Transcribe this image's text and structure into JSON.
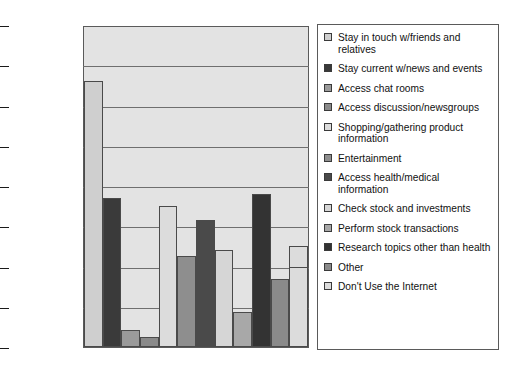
{
  "chart_data": {
    "type": "bar",
    "title": "",
    "subtitle": "",
    "xlabel": "",
    "ylabel": "",
    "ylim": [
      0,
      80
    ],
    "ytick_labels": [
      "80.00%",
      "70.00%",
      "60.00%",
      "50.00%",
      "40.00%",
      "30.00%",
      "20.00%",
      "10.00%",
      "0.00%"
    ],
    "ytick_values": [
      80,
      70,
      60,
      50,
      40,
      30,
      20,
      10,
      0
    ],
    "grid": true,
    "legend_position": "right",
    "categories": [
      "Stay in touch w/friends and relatives",
      "Stay current w/news and events",
      "Access chat rooms",
      "Access discussion/newsgroups",
      "Shopping/gathering product information",
      "Entertainment",
      "Access health/medical information",
      "Check stock and investments",
      "Perform stock transactions",
      "Research topics other than health",
      "Other",
      "Don't Use the Internet"
    ],
    "values": [
      66.0,
      37.0,
      4.3,
      2.5,
      35.0,
      22.5,
      31.5,
      24.0,
      8.8,
      38.0,
      16.8,
      25.0
    ],
    "bar_colors": [
      "#cfcfcf",
      "#3a3a3a",
      "#9a9a9a",
      "#8a8a8a",
      "#dcdcdc",
      "#8e8e8e",
      "#4a4a4a",
      "#d6d6d6",
      "#a8a8a8",
      "#333333",
      "#8a8a8a",
      "#dcdcdc"
    ],
    "annotations": [
      {
        "series_index": 12,
        "note": "inner segment at 20.00%",
        "value": 20.0
      }
    ],
    "plot_background": "#e3e3e3",
    "axis_color": "#5a5a5a"
  },
  "legend": {
    "items": [
      {
        "label": "Stay in touch w/friends and relatives",
        "color": "#cfcfcf"
      },
      {
        "label": "Stay current w/news and events",
        "color": "#3a3a3a"
      },
      {
        "label": "Access chat rooms",
        "color": "#9a9a9a"
      },
      {
        "label": "Access discussion/newsgroups",
        "color": "#8a8a8a"
      },
      {
        "label": "Shopping/gathering product information",
        "color": "#dcdcdc"
      },
      {
        "label": "Entertainment",
        "color": "#8e8e8e"
      },
      {
        "label": "Access health/medical information",
        "color": "#4a4a4a"
      },
      {
        "label": "Check stock and investments",
        "color": "#d6d6d6"
      },
      {
        "label": "Perform stock transactions",
        "color": "#a8a8a8"
      },
      {
        "label": "Research topics other than health",
        "color": "#333333"
      },
      {
        "label": "Other",
        "color": "#8a8a8a"
      },
      {
        "label": "Don't Use the Internet",
        "color": "#dcdcdc"
      }
    ]
  }
}
